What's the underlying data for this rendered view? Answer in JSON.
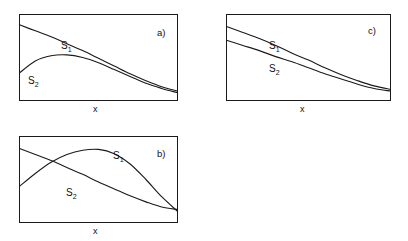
{
  "figure": {
    "title": "",
    "background_color": "#ffffff",
    "line_color": "#1a1a1a",
    "panels": [
      {
        "id": "a",
        "label": "a)",
        "xlabel": "x",
        "series_labels": [
          "S",
          "S"
        ],
        "series_subscripts": [
          "1",
          "2"
        ]
      },
      {
        "id": "b",
        "label": "b)",
        "xlabel": "x",
        "series_labels": [
          "S",
          "S"
        ],
        "series_subscripts": [
          "1",
          "2"
        ]
      },
      {
        "id": "c",
        "label": "c)",
        "xlabel": "x",
        "series_labels": [
          "S",
          "S"
        ],
        "series_subscripts": [
          "1",
          "2"
        ]
      }
    ]
  },
  "chart_data": [
    {
      "type": "line",
      "panel": "a",
      "title": "a)",
      "xlabel": "x",
      "ylabel": "",
      "xlim": [
        0,
        1
      ],
      "ylim": [
        0,
        1
      ],
      "grid": false,
      "legend": "inline-curve-labels",
      "series": [
        {
          "name": "S1",
          "x": [
            0.0,
            0.1,
            0.2,
            0.3,
            0.4,
            0.5,
            0.6,
            0.7,
            0.8,
            0.9,
            1.0
          ],
          "y": [
            0.88,
            0.81,
            0.74,
            0.66,
            0.58,
            0.49,
            0.4,
            0.31,
            0.23,
            0.16,
            0.11
          ]
        },
        {
          "name": "S2",
          "x": [
            0.0,
            0.1,
            0.2,
            0.3,
            0.4,
            0.5,
            0.6,
            0.7,
            0.8,
            0.9,
            1.0
          ],
          "y": [
            0.32,
            0.46,
            0.52,
            0.53,
            0.5,
            0.44,
            0.36,
            0.28,
            0.2,
            0.14,
            0.09
          ]
        }
      ]
    },
    {
      "type": "line",
      "panel": "b",
      "title": "b)",
      "xlabel": "x",
      "ylabel": "",
      "xlim": [
        0,
        1
      ],
      "ylim": [
        0,
        1
      ],
      "grid": false,
      "legend": "inline-curve-labels",
      "series": [
        {
          "name": "S1",
          "x": [
            0.0,
            0.1,
            0.2,
            0.3,
            0.4,
            0.5,
            0.6,
            0.7,
            0.8,
            0.9,
            1.0
          ],
          "y": [
            0.42,
            0.57,
            0.7,
            0.79,
            0.84,
            0.85,
            0.8,
            0.68,
            0.5,
            0.3,
            0.13
          ]
        },
        {
          "name": "S2",
          "x": [
            0.0,
            0.1,
            0.2,
            0.3,
            0.4,
            0.5,
            0.6,
            0.7,
            0.8,
            0.9,
            1.0
          ],
          "y": [
            0.86,
            0.79,
            0.72,
            0.64,
            0.56,
            0.47,
            0.39,
            0.31,
            0.24,
            0.18,
            0.15
          ]
        }
      ]
    },
    {
      "type": "line",
      "panel": "c",
      "title": "c)",
      "xlabel": "x",
      "ylabel": "",
      "xlim": [
        0,
        1
      ],
      "ylim": [
        0,
        1
      ],
      "grid": false,
      "legend": "inline-curve-labels",
      "series": [
        {
          "name": "S1",
          "x": [
            0.0,
            0.1,
            0.2,
            0.3,
            0.4,
            0.5,
            0.6,
            0.7,
            0.8,
            0.9,
            1.0
          ],
          "y": [
            0.86,
            0.79,
            0.72,
            0.64,
            0.55,
            0.47,
            0.38,
            0.3,
            0.23,
            0.17,
            0.13
          ]
        },
        {
          "name": "S2",
          "x": [
            0.0,
            0.1,
            0.2,
            0.3,
            0.4,
            0.5,
            0.6,
            0.7,
            0.8,
            0.9,
            1.0
          ],
          "y": [
            0.7,
            0.64,
            0.58,
            0.51,
            0.45,
            0.38,
            0.31,
            0.25,
            0.19,
            0.14,
            0.11
          ]
        }
      ]
    }
  ]
}
